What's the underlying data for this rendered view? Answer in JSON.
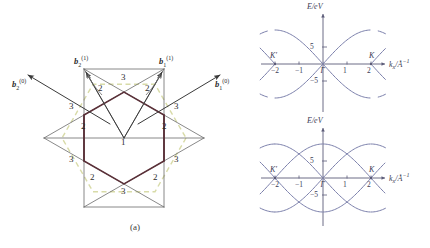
{
  "figure": {
    "captions": {
      "a": "(a)",
      "b": "(b)"
    }
  },
  "panel_a": {
    "title": "reciprocal-space Brillouin zone construction",
    "vectors": [
      {
        "id": "b2_0",
        "label_base": "b",
        "sub": "2",
        "sup": "(0)",
        "x": 18,
        "y": 82,
        "dir": "upper-left"
      },
      {
        "id": "b1_0",
        "label_base": "b",
        "sub": "1",
        "sup": "(0)",
        "x": 222,
        "y": 82,
        "dir": "upper-right"
      },
      {
        "id": "b2_1",
        "label_base": "b",
        "sub": "2",
        "sup": "(1)",
        "x": 79,
        "y": 60,
        "dir": "up-left"
      },
      {
        "id": "b1_1",
        "label_base": "b",
        "sub": "1",
        "sup": "(1)",
        "x": 163,
        "y": 60,
        "dir": "up-right"
      }
    ],
    "zone_numbers": [
      {
        "text": "1",
        "x": 124,
        "y": 143
      },
      {
        "text": "2",
        "x": 84,
        "y": 127
      },
      {
        "text": "2",
        "x": 165,
        "y": 127
      },
      {
        "text": "2",
        "x": 93,
        "y": 178
      },
      {
        "text": "2",
        "x": 156,
        "y": 178
      },
      {
        "text": "2",
        "x": 101,
        "y": 89
      },
      {
        "text": "2",
        "x": 148,
        "y": 89
      },
      {
        "text": "3",
        "x": 124,
        "y": 78
      },
      {
        "text": "3",
        "x": 124,
        "y": 192
      },
      {
        "text": "3",
        "x": 72,
        "y": 107
      },
      {
        "text": "3",
        "x": 177,
        "y": 107
      },
      {
        "text": "3",
        "x": 72,
        "y": 160
      },
      {
        "text": "3",
        "x": 177,
        "y": 160
      }
    ],
    "colors": {
      "dashed_hexagon": "#d8dba8",
      "dark_hexagon": "#5a3038",
      "thin_line": "#6b6b6b",
      "arrow": "#3a3a3a"
    }
  },
  "panel_b": {
    "charts": [
      {
        "id": "chart-top",
        "xlabel": "k",
        "xlabel_sub": "x",
        "xlabel_unit": "/Å⁻¹",
        "ylabel": "E/eV",
        "xticks": [
          {
            "value": -2,
            "text": "−2"
          },
          {
            "value": -1,
            "text": "−1"
          },
          {
            "value": 0,
            "text": "Γ"
          },
          {
            "value": 1,
            "text": "1"
          },
          {
            "value": 2,
            "text": "2"
          }
        ],
        "yticks": [
          {
            "value": 5,
            "text": "5"
          },
          {
            "value": -5,
            "text": "−5"
          }
        ],
        "kpoints": [
          {
            "text": "K′",
            "value": -2
          },
          {
            "text": "K",
            "value": 2
          }
        ]
      },
      {
        "id": "chart-bottom",
        "xlabel": "k",
        "xlabel_sub": "x",
        "xlabel_unit": "/Å⁻¹",
        "ylabel": "E/eV",
        "xticks": [
          {
            "value": -2,
            "text": "−2"
          },
          {
            "value": -1,
            "text": "−1"
          },
          {
            "value": 0,
            "text": "Γ"
          },
          {
            "value": 1,
            "text": "1"
          },
          {
            "value": 2,
            "text": "2"
          }
        ],
        "yticks": [
          {
            "value": 5,
            "text": "5"
          },
          {
            "value": -5,
            "text": "−5"
          }
        ],
        "kpoints": [
          {
            "text": "K′",
            "value": -2
          },
          {
            "text": "K",
            "value": 2
          }
        ]
      }
    ],
    "colors": {
      "band": "#7b7fab",
      "axis": "#5b5b78"
    }
  },
  "chart_data": [
    {
      "type": "line",
      "id": "chart-top",
      "title": "",
      "xlabel": "k_x/Å⁻¹",
      "ylabel": "E/eV",
      "xlim": [
        -2.9,
        2.9
      ],
      "ylim": [
        -11,
        11
      ],
      "xticks": [
        -2,
        -1,
        0,
        1,
        2
      ],
      "xticklabels": [
        "−2",
        "−1",
        "Γ",
        "1",
        "2"
      ],
      "yticks": [
        -5,
        5
      ],
      "yticklabels": [
        "−5",
        "5"
      ],
      "grid": false,
      "legend": null,
      "annotations": [
        {
          "text": "K′",
          "x": -2,
          "y": 0
        },
        {
          "text": "K",
          "x": 2,
          "y": 0
        }
      ],
      "series": [
        {
          "name": "conduction band (valence cone, Gamma-centered)",
          "x": [
            -2.9,
            -2.6,
            -2.3,
            -2.0,
            -1.7,
            -1.4,
            -1.1,
            -0.8,
            -0.5,
            -0.2,
            0.0,
            0.2,
            0.5,
            0.8,
            1.1,
            1.4,
            1.7,
            2.0,
            2.3,
            2.6,
            2.9
          ],
          "values": [
            2.7,
            1.8,
            0.9,
            0.0,
            2.6,
            4.9,
            6.9,
            8.4,
            9.4,
            9.9,
            10.0,
            9.9,
            9.4,
            8.4,
            6.9,
            4.9,
            2.6,
            0.0,
            0.9,
            1.8,
            2.7
          ]
        },
        {
          "name": "valence band (Gamma-centered)",
          "x": [
            -2.9,
            -2.6,
            -2.3,
            -2.0,
            -1.7,
            -1.4,
            -1.1,
            -0.8,
            -0.5,
            -0.2,
            0.0,
            0.2,
            0.5,
            0.8,
            1.1,
            1.4,
            1.7,
            2.0,
            2.3,
            2.6,
            2.9
          ],
          "values": [
            -2.7,
            -1.8,
            -0.9,
            0.0,
            -2.6,
            -4.9,
            -6.9,
            -8.4,
            -9.4,
            -9.9,
            -10.0,
            -9.9,
            -9.4,
            -8.4,
            -6.9,
            -4.9,
            -2.6,
            0.0,
            -0.9,
            -1.8,
            -2.7
          ]
        }
      ]
    },
    {
      "type": "line",
      "id": "chart-bottom",
      "title": "",
      "xlabel": "k_x/Å⁻¹",
      "ylabel": "E/eV",
      "xlim": [
        -2.9,
        2.9
      ],
      "ylim": [
        -11,
        11
      ],
      "xticks": [
        -2,
        -1,
        0,
        1,
        2
      ],
      "xticklabels": [
        "−2",
        "−1",
        "Γ",
        "1",
        "2"
      ],
      "yticks": [
        -5,
        5
      ],
      "yticklabels": [
        "−5",
        "5"
      ],
      "grid": false,
      "legend": null,
      "annotations": [
        {
          "text": "K′",
          "x": -2,
          "y": 0
        },
        {
          "text": "K",
          "x": 2,
          "y": 0
        }
      ],
      "description": "zone-folded bands: Dirac cones at Γ, ±2 and replicas, multiple overlapping band pairs",
      "series": [
        {
          "name": "cone centered at Γ (upper)",
          "center": 0.0,
          "branch": "upper",
          "x": [
            -2.0,
            -1.5,
            -1.0,
            -0.5,
            0.0,
            0.5,
            1.0,
            1.5,
            2.0
          ],
          "values": [
            0.0,
            4.9,
            8.4,
            9.9,
            10.0,
            9.9,
            8.4,
            4.9,
            0.0
          ]
        },
        {
          "name": "cone centered at Γ (lower)",
          "center": 0.0,
          "branch": "lower",
          "x": [
            -2.0,
            -1.5,
            -1.0,
            -0.5,
            0.0,
            0.5,
            1.0,
            1.5,
            2.0
          ],
          "values": [
            0.0,
            -4.9,
            -8.4,
            -9.9,
            -10.0,
            -9.9,
            -8.4,
            -4.9,
            0.0
          ]
        },
        {
          "name": "cone centered at K (+2) (upper)",
          "center": 2.0,
          "branch": "upper",
          "x": [
            0.0,
            0.5,
            1.0,
            1.5,
            2.0,
            2.5,
            2.9
          ],
          "values": [
            10.0,
            9.9,
            8.4,
            4.9,
            0.0,
            4.9,
            8.1
          ]
        },
        {
          "name": "cone centered at K (+2) (lower)",
          "center": 2.0,
          "branch": "lower",
          "x": [
            0.0,
            0.5,
            1.0,
            1.5,
            2.0,
            2.5,
            2.9
          ],
          "values": [
            -10.0,
            -9.9,
            -8.4,
            -4.9,
            0.0,
            -4.9,
            -8.1
          ]
        },
        {
          "name": "cone centered at K′ (−2) (upper)",
          "center": -2.0,
          "branch": "upper",
          "x": [
            -2.9,
            -2.5,
            -2.0,
            -1.5,
            -1.0,
            -0.5,
            0.0
          ],
          "values": [
            8.1,
            4.9,
            0.0,
            4.9,
            8.4,
            9.9,
            10.0
          ]
        },
        {
          "name": "cone centered at K′ (−2) (lower)",
          "center": -2.0,
          "branch": "lower",
          "x": [
            -2.9,
            -2.5,
            -2.0,
            -1.5,
            -1.0,
            -0.5,
            0.0
          ],
          "values": [
            -8.1,
            -4.9,
            0.0,
            -4.9,
            -8.4,
            -9.9,
            -10.0
          ]
        },
        {
          "name": "replica cone centered at +4 (upper, partially visible)",
          "center": 4.0,
          "branch": "upper",
          "x": [
            2.0,
            2.5,
            2.9
          ],
          "values": [
            0.0,
            4.9,
            8.1
          ]
        },
        {
          "name": "replica cone centered at −4 (upper, partially visible)",
          "center": -4.0,
          "branch": "upper",
          "x": [
            -2.9,
            -2.5,
            -2.0
          ],
          "values": [
            8.1,
            4.9,
            0.0
          ]
        }
      ]
    }
  ]
}
